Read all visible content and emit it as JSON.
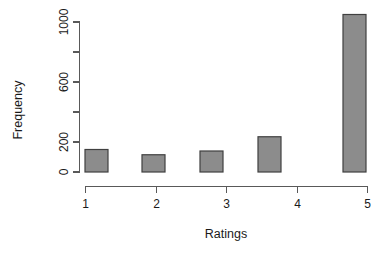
{
  "chart_data": {
    "type": "bar",
    "title": "",
    "subtitle": "",
    "xlabel": "Ratings",
    "ylabel": "Frequency",
    "categories": [
      "1",
      "2",
      "3",
      "4",
      "5"
    ],
    "values": [
      150,
      115,
      140,
      235,
      1050
    ],
    "series": [
      {
        "name": "Frequency",
        "values": [
          150,
          115,
          140,
          235,
          1050
        ]
      }
    ],
    "xlim": [
      0.6,
      5.6
    ],
    "ylim": [
      0,
      1060
    ],
    "x_tick_labels": [
      "1",
      "2",
      "3",
      "4",
      "5"
    ],
    "x_tick_values": [
      1,
      2,
      3,
      4,
      5
    ],
    "y_tick_labels": [
      "0",
      "200",
      "",
      "600",
      "",
      "1000"
    ],
    "y_tick_values": [
      0,
      200,
      400,
      600,
      800,
      1000
    ],
    "grid": false,
    "legend": false,
    "legend_position": "none",
    "bar_fill_color": "#8c8c8c",
    "bar_border_color": "#404040",
    "axis_color": "#595959",
    "background_color": "#ffffff",
    "y_label_rotation": -90,
    "y_tick_label_rotation": -90
  },
  "axes": {
    "y_axis_name": "frequency-axis",
    "x_axis_name": "ratings-axis"
  }
}
